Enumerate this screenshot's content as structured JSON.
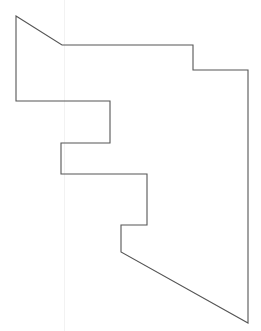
{
  "diagram": {
    "type": "polygon-outline",
    "stroke_color": "#555555",
    "fill_color": "none",
    "stroke_width": 1.1,
    "guide_line_x": 64,
    "guide_color": "#f2f2f2",
    "vertices": [
      [
        16,
        16
      ],
      [
        62,
        45
      ],
      [
        193,
        45
      ],
      [
        193,
        70
      ],
      [
        248,
        70
      ],
      [
        248,
        323
      ],
      [
        121,
        252
      ],
      [
        121,
        225
      ],
      [
        147,
        225
      ],
      [
        147,
        174
      ],
      [
        61,
        174
      ],
      [
        61,
        143
      ],
      [
        110,
        143
      ],
      [
        110,
        101
      ],
      [
        16,
        101
      ]
    ]
  }
}
